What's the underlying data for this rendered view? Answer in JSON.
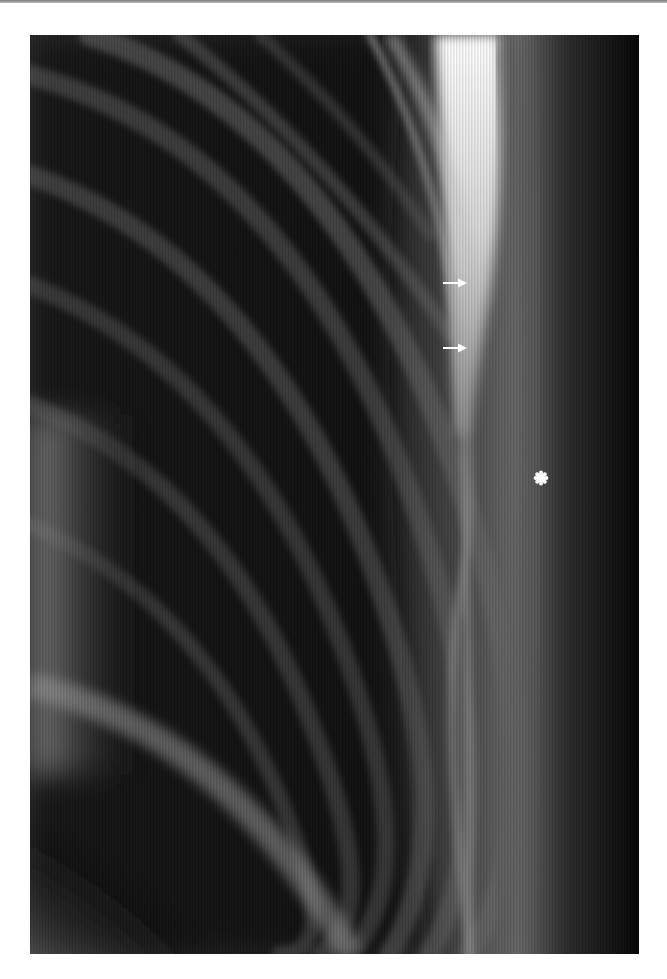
{
  "figure": {
    "type": "radiograph",
    "colors": {
      "background": "#ffffff",
      "film_dark": "#0a0a0a",
      "bone_bright": "#f2f2f2",
      "annotation": "#ffffff"
    },
    "annotations": [
      {
        "kind": "arrow",
        "direction": "right",
        "x": 443,
        "y": 283
      },
      {
        "kind": "arrow",
        "direction": "right",
        "x": 443,
        "y": 348
      },
      {
        "kind": "asterisk",
        "x": 541,
        "y": 478
      }
    ]
  }
}
